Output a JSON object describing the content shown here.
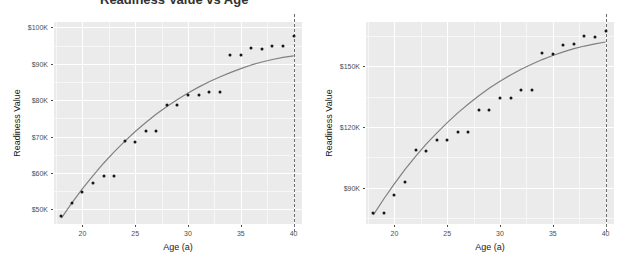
{
  "figure": {
    "title_fragment": "Readiness Value vs Age",
    "panel_count": 2
  },
  "chart_data": [
    {
      "type": "scatter",
      "panel": "left",
      "title": "",
      "xlabel": "Age (a)",
      "ylabel": "Readiness Value",
      "xlim": [
        17.3,
        40.8
      ],
      "ylim": [
        46000,
        101500
      ],
      "xticks": [
        20,
        25,
        30,
        35,
        40
      ],
      "xticklabels": [
        "20",
        "25",
        "30",
        "35",
        "40"
      ],
      "yticks": [
        50000,
        60000,
        70000,
        80000,
        90000,
        100000
      ],
      "yticklabels": [
        "$50K",
        "$60K",
        "$70K",
        "$80K",
        "$90K",
        "$100K"
      ],
      "grid": true,
      "legend": "none",
      "x": [
        18,
        19,
        20,
        21,
        22,
        23,
        24,
        25,
        26,
        27,
        28,
        29,
        30,
        31,
        32,
        33,
        34,
        35,
        36,
        37,
        38,
        39,
        40
      ],
      "values": [
        48200,
        51800,
        54800,
        57300,
        59300,
        59300,
        68700,
        68600,
        71500,
        71500,
        78600,
        78600,
        81500,
        81400,
        82300,
        82300,
        92500,
        92500,
        94400,
        94100,
        94900,
        95000,
        97600
      ],
      "series": [
        {
          "name": "observed",
          "type": "scatter",
          "values": [
            48200,
            51800,
            54800,
            57300,
            59300,
            59300,
            68700,
            68600,
            71500,
            71500,
            78600,
            78600,
            81500,
            81400,
            82300,
            82300,
            92500,
            92500,
            94400,
            94100,
            94900,
            95000,
            97600
          ]
        },
        {
          "name": "fitted-curve",
          "type": "line",
          "color": "#808080",
          "values": [
            47600,
            51800,
            55700,
            59300,
            62700,
            65800,
            68700,
            71400,
            73900,
            76200,
            78300,
            80200,
            82000,
            83600,
            85100,
            86400,
            87600,
            88700,
            89700,
            90500,
            91200,
            91800,
            92200
          ]
        }
      ],
      "annotations": [
        {
          "type": "vline",
          "x": 40,
          "style": "dashed",
          "color": "#6e6e6e"
        }
      ]
    },
    {
      "type": "scatter",
      "panel": "right",
      "title": "",
      "xlabel": "Age (a)",
      "ylabel": "Readiness Value",
      "xlim": [
        17.3,
        40.8
      ],
      "ylim": [
        72000,
        172000
      ],
      "xticks": [
        20,
        25,
        30,
        35,
        40
      ],
      "xticklabels": [
        "20",
        "25",
        "30",
        "35",
        "40"
      ],
      "yticks": [
        90000,
        120000,
        150000
      ],
      "yticklabels": [
        "$90K",
        "$120K",
        "$150K"
      ],
      "grid": true,
      "legend": "none",
      "x": [
        18,
        19,
        20,
        21,
        22,
        23,
        24,
        25,
        26,
        27,
        28,
        29,
        30,
        31,
        32,
        33,
        34,
        35,
        36,
        37,
        38,
        39,
        40
      ],
      "values": [
        77500,
        77500,
        86500,
        93000,
        108500,
        108000,
        113500,
        113500,
        117500,
        117500,
        128500,
        128500,
        134500,
        134500,
        138500,
        138500,
        156500,
        156000,
        160500,
        161000,
        165000,
        164500,
        167500
      ],
      "series": [
        {
          "name": "observed",
          "type": "scatter",
          "values": [
            77500,
            77500,
            86500,
            93000,
            108500,
            108000,
            113500,
            113500,
            117500,
            117500,
            128500,
            128500,
            134500,
            134500,
            138500,
            138500,
            156500,
            156000,
            160500,
            161000,
            165000,
            164500,
            167500
          ]
        },
        {
          "name": "fitted-curve",
          "type": "line",
          "color": "#808080",
          "values": [
            76500,
            84500,
            92000,
            99000,
            105500,
            111500,
            117000,
            122200,
            127000,
            131400,
            135500,
            139300,
            142700,
            145800,
            148600,
            151100,
            153400,
            155400,
            157200,
            158800,
            160100,
            161200,
            162100
          ]
        }
      ],
      "annotations": [
        {
          "type": "vline",
          "x": 40,
          "style": "dashed",
          "color": "#6e6e6e"
        }
      ]
    }
  ],
  "style": {
    "panel_background": "#ebebeb",
    "gridline_color": "#ffffff",
    "point_color": "#161616",
    "curve_color": "#808080",
    "vline_color": "#6e6e6e",
    "text_color": "#4d4d4d"
  }
}
